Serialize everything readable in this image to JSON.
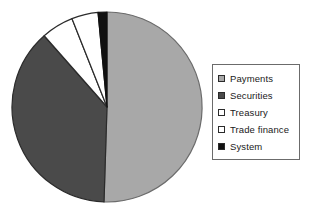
{
  "chart_data": {
    "type": "pie",
    "title": "",
    "categories": [
      "Payments",
      "Securities",
      "Treasury",
      "Trade finance",
      "System"
    ],
    "values": [
      50.5,
      38.0,
      5.5,
      4.5,
      1.5
    ],
    "unit": "percent",
    "colors": [
      "#a8a8a8",
      "#4a4a4a",
      "#ffffff",
      "#ffffff",
      "#111111"
    ],
    "slice_borders": [
      "#6b6b6b",
      "#2b2b2b",
      "#2b2b2b",
      "#2b2b2b",
      "#111111"
    ],
    "start_angle_deg": 0,
    "direction": "clockwise",
    "legend_position": "right",
    "grid": false,
    "xlabel": "",
    "ylabel": ""
  },
  "legend": {
    "items": [
      {
        "label": "Payments",
        "color": "#a8a8a8"
      },
      {
        "label": "Securities",
        "color": "#4a4a4a"
      },
      {
        "label": "Treasury",
        "color": "#ffffff"
      },
      {
        "label": "Trade finance",
        "color": "#ffffff"
      },
      {
        "label": "System",
        "color": "#111111"
      }
    ]
  }
}
